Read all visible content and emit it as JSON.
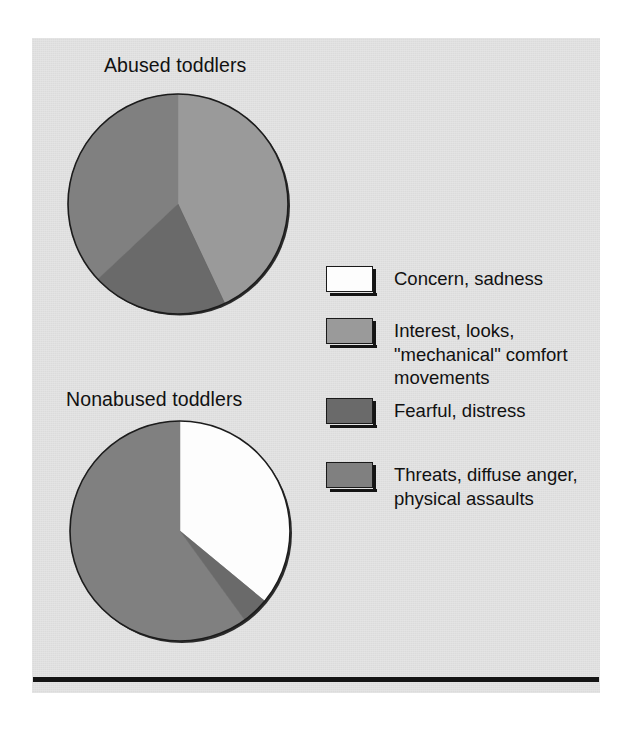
{
  "figure": {
    "background_color": "#e0e0e0",
    "page_color": "#ffffff",
    "rule_color": "#141414"
  },
  "legend": {
    "items": [
      {
        "label": "Concern, sadness",
        "color": "#fdfdfd",
        "key": "concern-sadness"
      },
      {
        "label": "Interest, looks,\n\"mechanical\" comfort\nmovements",
        "color": "#9a9a9a",
        "key": "interest-looks"
      },
      {
        "label": "Fearful, distress",
        "color": "#6a6a6a",
        "key": "fearful-distress"
      },
      {
        "label": "Threats, diffuse anger,\nphysical assaults",
        "color": "#808080",
        "key": "threats-anger"
      }
    ]
  },
  "charts": {
    "abused": {
      "title": "Abused toddlers"
    },
    "nonabused": {
      "title": "Nonabused toddlers"
    }
  },
  "chart_data": [
    {
      "type": "pie",
      "title": "Abused toddlers",
      "categories": [
        "Concern, sadness",
        "Interest, looks, \"mechanical\" comfort movements",
        "Fearful, distress",
        "Threats, diffuse anger, physical assaults"
      ],
      "values": [
        0,
        43,
        20,
        37
      ],
      "colors": [
        "#fdfdfd",
        "#9a9a9a",
        "#6a6a6a",
        "#808080"
      ],
      "units": "percent",
      "start_angle_deg": 0,
      "direction": "clockwise",
      "legend_position": "right"
    },
    {
      "type": "pie",
      "title": "Nonabused toddlers",
      "categories": [
        "Concern, sadness",
        "Interest, looks, \"mechanical\" comfort movements",
        "Fearful, distress",
        "Threats, diffuse anger, physical assaults"
      ],
      "values": [
        36,
        0,
        4,
        60
      ],
      "colors": [
        "#fdfdfd",
        "#9a9a9a",
        "#6a6a6a",
        "#808080"
      ],
      "units": "percent",
      "start_angle_deg": 0,
      "direction": "clockwise",
      "legend_position": "right"
    }
  ]
}
